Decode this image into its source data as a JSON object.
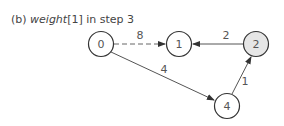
{
  "caption": {
    "prefix": "(b) ",
    "italic": "weight",
    "suffix": "[1] in step 3"
  },
  "graph": {
    "nodes": [
      {
        "id": "0",
        "label": "0",
        "x": 101,
        "y": 44,
        "fill": "#ffffff"
      },
      {
        "id": "1",
        "label": "1",
        "x": 179,
        "y": 44,
        "fill": "#ffffff"
      },
      {
        "id": "2",
        "label": "2",
        "x": 256,
        "y": 44,
        "fill": "#e6e6e6"
      },
      {
        "id": "4",
        "label": "4",
        "x": 227,
        "y": 106,
        "fill": "#ffffff"
      }
    ],
    "edges": [
      {
        "from": "0",
        "to": "1",
        "weight": "8",
        "style": "dashed"
      },
      {
        "from": "2",
        "to": "1",
        "weight": "2",
        "style": "solid"
      },
      {
        "from": "0",
        "to": "4",
        "weight": "4",
        "style": "solid"
      },
      {
        "from": "4",
        "to": "2",
        "weight": "1",
        "style": "solid"
      }
    ]
  }
}
